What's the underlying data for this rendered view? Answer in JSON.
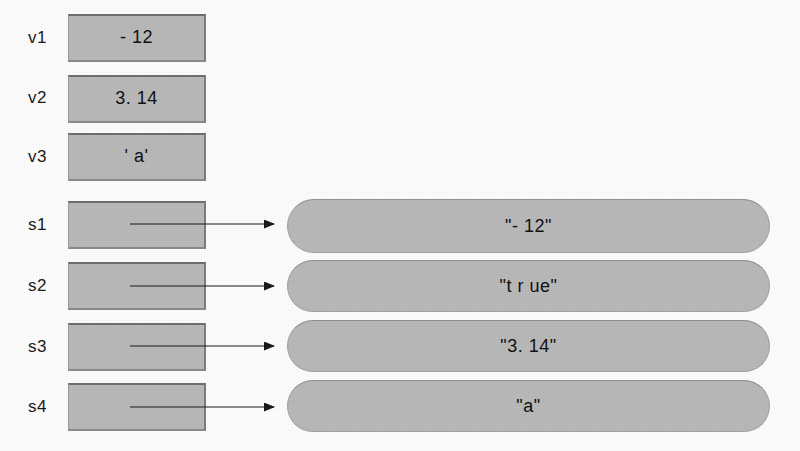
{
  "diagram": {
    "colors": {
      "box_fill": "#b9b9b9",
      "box_border": "#8a8a8a",
      "text": "#111111",
      "arrow": "#1a1a1a",
      "background": "#fdfdfd"
    },
    "primitive_variables": [
      {
        "label": "v1",
        "value": "- 12"
      },
      {
        "label": "v2",
        "value": "3. 14"
      },
      {
        "label": "v3",
        "value": "' a'"
      }
    ],
    "reference_variables": [
      {
        "label": "s1",
        "value": ""
      },
      {
        "label": "s2",
        "value": ""
      },
      {
        "label": "s3",
        "value": ""
      },
      {
        "label": "s4",
        "value": ""
      }
    ],
    "string_objects": [
      {
        "value": "\"- 12\""
      },
      {
        "value": "\"t r ue\""
      },
      {
        "value": "\"3. 14\""
      },
      {
        "value": "\"a\""
      }
    ],
    "arrows": [
      {
        "from": "s1",
        "to": "\"- 12\""
      },
      {
        "from": "s2",
        "to": "\"t r ue\""
      },
      {
        "from": "s3",
        "to": "\"3. 14\""
      },
      {
        "from": "s4",
        "to": "\"a\""
      }
    ]
  }
}
